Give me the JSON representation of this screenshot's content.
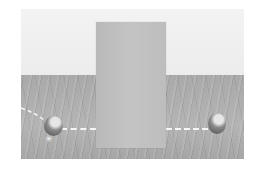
{
  "scene": {
    "description": "Rendered 3D scene: a tall flat panel standing on a wooden floor against a light wall, with a ball on each side and a dashed trajectory line passing behind the panel",
    "colors": {
      "wall": "#f1f1f1",
      "floor": "#aeaeae",
      "panel": "#c0c0c0",
      "trajectory": "#f5f5f5",
      "ball": "#6a6a6a"
    },
    "objects": [
      {
        "name": "panel",
        "type": "occluder"
      },
      {
        "name": "left-ball",
        "type": "sphere"
      },
      {
        "name": "right-ball",
        "type": "sphere"
      },
      {
        "name": "trajectory",
        "type": "dashed-line"
      }
    ]
  }
}
